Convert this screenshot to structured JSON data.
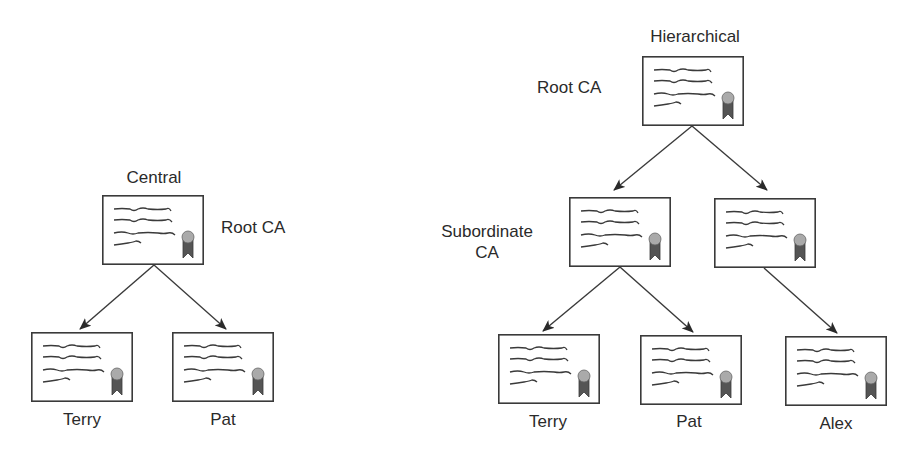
{
  "diagram": {
    "central": {
      "title": "Central",
      "root_label": "Root CA",
      "leaves": [
        "Terry",
        "Pat"
      ]
    },
    "hierarchical": {
      "title": "Hierarchical",
      "root_label": "Root CA",
      "subordinate_label_line1": "Subordinate",
      "subordinate_label_line2": "CA",
      "leaves": [
        "Terry",
        "Pat",
        "Alex"
      ]
    },
    "colors": {
      "line": "#3a3a3a",
      "seal": "#aaaaaa",
      "ribbon": "#555555"
    }
  },
  "certificates": [
    {
      "id": "central-root",
      "x": 102,
      "y": 195
    },
    {
      "id": "central-terry",
      "x": 31,
      "y": 332
    },
    {
      "id": "central-pat",
      "x": 172,
      "y": 332
    },
    {
      "id": "hier-root",
      "x": 642,
      "y": 56
    },
    {
      "id": "hier-sub-left",
      "x": 569,
      "y": 197
    },
    {
      "id": "hier-sub-right",
      "x": 714,
      "y": 198
    },
    {
      "id": "hier-terry",
      "x": 498,
      "y": 334
    },
    {
      "id": "hier-pat",
      "x": 640,
      "y": 335
    },
    {
      "id": "hier-alex",
      "x": 785,
      "y": 336
    }
  ]
}
